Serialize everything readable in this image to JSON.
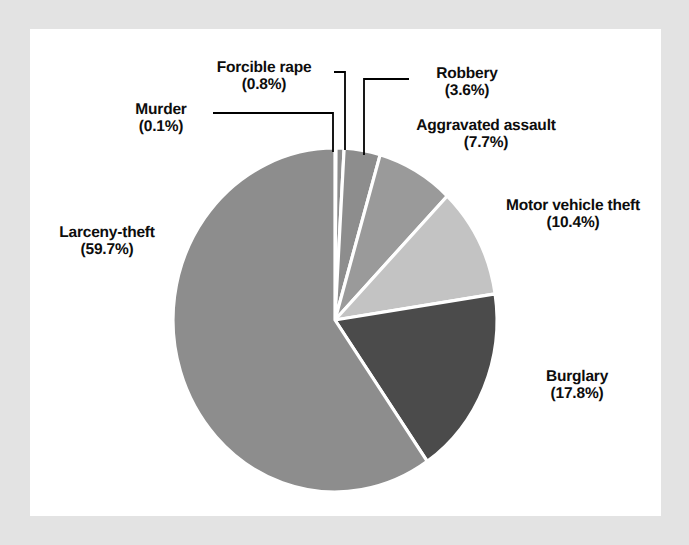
{
  "figure": {
    "background_color": "#e3e3e3",
    "panel_color": "#ffffff",
    "text_color": "#0d0d0d",
    "leader_line_color": "#000000",
    "slice_gap_color": "#ffffff"
  },
  "chart_data": {
    "type": "pie",
    "title": "",
    "subtitle": "",
    "xlabel": "",
    "ylabel": "",
    "legend_position": "none",
    "grid": false,
    "labels_show_percent": true,
    "total_percent": 100.1,
    "start_angle_deg": -90,
    "direction": "clockwise",
    "categories": [
      "Murder",
      "Forcible rape",
      "Robbery",
      "Aggravated assault",
      "Motor vehicle theft",
      "Burglary",
      "Larceny-theft"
    ],
    "values": [
      0.1,
      0.8,
      3.6,
      7.7,
      10.4,
      17.8,
      59.7
    ],
    "slices": [
      {
        "name": "Murder",
        "percent": 0.1,
        "percent_label": "(0.1%)",
        "color": "#8d8d8d",
        "label_align": "right",
        "leader": "elbow-left"
      },
      {
        "name": "Forcible rape",
        "percent": 0.8,
        "percent_label": "(0.8%)",
        "color": "#8d8d8d",
        "label_align": "center",
        "leader": "elbow-down"
      },
      {
        "name": "Robbery",
        "percent": 3.6,
        "percent_label": "(3.6%)",
        "color": "#8d8d8d",
        "label_align": "center",
        "leader": "elbow-right"
      },
      {
        "name": "Aggravated assault",
        "percent": 7.7,
        "percent_label": "(7.7%)",
        "color": "#9a9a9a",
        "label_align": "center",
        "leader": "none"
      },
      {
        "name": "Motor vehicle theft",
        "percent": 10.4,
        "percent_label": "(10.4%)",
        "color": "#c3c3c3",
        "label_align": "center",
        "leader": "none"
      },
      {
        "name": "Burglary",
        "percent": 17.8,
        "percent_label": "(17.8%)",
        "color": "#4b4b4b",
        "label_align": "center",
        "leader": "none"
      },
      {
        "name": "Larceny-theft",
        "percent": 59.7,
        "percent_label": "(59.7%)",
        "color": "#8d8d8d",
        "label_align": "center",
        "leader": "none"
      }
    ]
  }
}
